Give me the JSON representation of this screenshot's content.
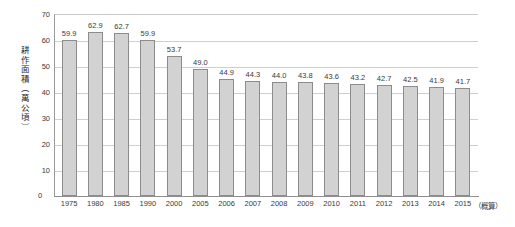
{
  "chart_data": {
    "type": "bar",
    "title": "",
    "subtitle": "",
    "xlabel": "",
    "ylabel": "耕作面積（萬公頃）",
    "ylim": [
      0,
      70
    ],
    "yticks": [
      0,
      10,
      20,
      30,
      40,
      50,
      60,
      70
    ],
    "grid": true,
    "legend": null,
    "annotations": [
      "（概算）"
    ],
    "categories": [
      "1975",
      "1980",
      "1985",
      "1990",
      "2000",
      "2005",
      "2006",
      "2007",
      "2008",
      "2009",
      "2010",
      "2011",
      "2012",
      "2013",
      "2014",
      "2015"
    ],
    "values": [
      59.9,
      62.9,
      62.7,
      59.9,
      53.7,
      49.0,
      44.9,
      44.3,
      44.0,
      43.8,
      43.6,
      43.2,
      42.7,
      42.5,
      41.9,
      41.7
    ],
    "value_labels": [
      "59.9",
      "62.9",
      "62.7",
      "59.9",
      "53.7",
      "49.0",
      "44.9",
      "44.3",
      "44.0",
      "43.8",
      "43.6",
      "43.2",
      "42.7",
      "42.5",
      "41.9",
      "41.7"
    ],
    "ytick_labels": [
      "0",
      "10",
      "20",
      "30",
      "40",
      "50",
      "60",
      "70"
    ],
    "zero_label": "0",
    "estimate_note": "（概算）"
  },
  "colors": {
    "bar_fill": "#d2d2d2",
    "bar_stroke": "#8c8c8c",
    "gridline": "#cfcfcf",
    "axis": "#8f8f8f",
    "text": "#3a3a3a",
    "background": "#ffffff"
  }
}
